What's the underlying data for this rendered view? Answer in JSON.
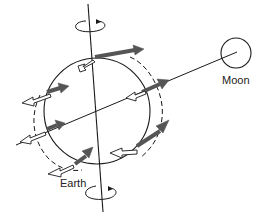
{
  "diagram": {
    "type": "tidal-forces",
    "labels": {
      "earth": "Earth",
      "moon": "Moon"
    },
    "colors": {
      "line": "#1a1a1a",
      "filled_arrow": "#555555",
      "hollow_arrow_fill": "#ffffff",
      "background": "#ffffff"
    },
    "elements": {
      "earth_circle": "Earth",
      "moon_circle": "Moon",
      "rotation_axis": "tilted rotation axis",
      "earth_moon_line": "line connecting Earth center to Moon",
      "tidal_bulge": "dashed tidal bulge ellipse",
      "filled_arrows": "gravitational attraction toward Moon",
      "hollow_arrows": "centrifugal / residual force vectors",
      "rotation_indicators": [
        "top rotation arrow",
        "bottom rotation arrow"
      ]
    }
  }
}
